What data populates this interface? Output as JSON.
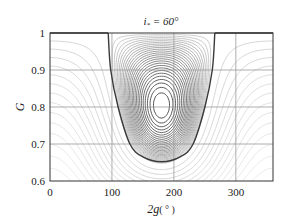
{
  "chart_data": {
    "type": "contour",
    "title": "i* = 60°",
    "title_parts": {
      "symbol": "i",
      "subscript": "*",
      "rest": " = 60°"
    },
    "xlabel": "2g ( ° )",
    "xlabel_parts": {
      "main": "2g",
      "unit": "( ° )"
    },
    "ylabel": "G",
    "xlim": [
      0,
      360
    ],
    "ylim": [
      0.6,
      1.0
    ],
    "xticks": [
      0,
      100,
      200,
      300
    ],
    "xtick_labels": [
      "0",
      "100",
      "200",
      "300"
    ],
    "yticks": [
      0.6,
      0.7,
      0.8,
      0.9,
      1.0
    ],
    "ytick_labels": [
      "0.6",
      "0.7",
      "0.8",
      "0.9",
      "1"
    ],
    "grid": true,
    "grid_x": [
      100,
      200,
      300
    ],
    "grid_y": [
      0.7,
      0.8,
      0.9
    ],
    "separatrix": {
      "description": "Dark U-shaped separatrix centered at 2g = 180°",
      "points": [
        [
          94,
          1.0
        ],
        [
          98,
          0.9
        ],
        [
          110,
          0.8
        ],
        [
          129,
          0.7
        ],
        [
          150,
          0.665
        ],
        [
          180,
          0.652
        ],
        [
          210,
          0.665
        ],
        [
          231,
          0.7
        ],
        [
          250,
          0.8
        ],
        [
          262,
          0.9
        ],
        [
          266,
          1.0
        ]
      ],
      "min": {
        "x": 180,
        "y": 0.652
      }
    },
    "contour_levels_inside": 14,
    "contour_levels_outside": 26,
    "legend": null
  },
  "colors": {
    "separatrix": "#3a3a3a",
    "contour_dark": "#2a2a2a",
    "contour_light": "#c8c8c8",
    "grid": "#9a9a9a",
    "frame": "#333333"
  },
  "labels": {
    "y0": "0.6",
    "y1": "0.7",
    "y2": "0.8",
    "y3": "0.9",
    "y4": "1",
    "x0": "0",
    "x1": "100",
    "x2": "200",
    "x3": "300",
    "title_i": "i",
    "title_sub": "*",
    "title_rest": " = 60°",
    "ylabel": "G",
    "xlabel_main": "2g",
    "xlabel_unit": "( ° )"
  }
}
